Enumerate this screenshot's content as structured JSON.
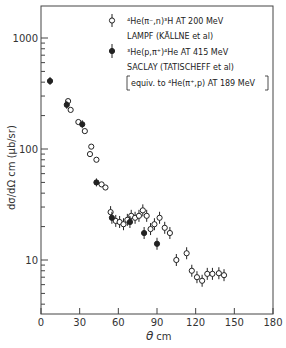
{
  "chart_data": {
    "type": "scatter",
    "title": "",
    "xlabel": "θ cm",
    "ylabel": "dσ/dΩ cm (μb/sr)",
    "xlim": [
      0,
      180
    ],
    "ylim": [
      6,
      1800
    ],
    "yscale": "log",
    "grid": false,
    "legend_position": "upper right",
    "x_ticks": [
      0,
      30,
      60,
      90,
      120,
      150,
      180
    ],
    "x_tick_labels": [
      "0",
      "30",
      "60",
      "90",
      "120",
      "150",
      "180"
    ],
    "y_ticks": [
      10,
      100,
      1000
    ],
    "y_tick_labels": [
      "10",
      "100",
      "1000"
    ],
    "series": [
      {
        "name": "4He(π−,n)3H AT 200 MeV — LAMPF (KÄLLNE et al)",
        "marker": "open-circle",
        "points": [
          {
            "x": 21,
            "y": 270
          },
          {
            "x": 23,
            "y": 225
          },
          {
            "x": 29,
            "y": 175
          },
          {
            "x": 34,
            "y": 145
          },
          {
            "x": 38,
            "y": 90
          },
          {
            "x": 39,
            "y": 105
          },
          {
            "x": 43,
            "y": 80
          },
          {
            "x": 47,
            "y": 48
          },
          {
            "x": 50,
            "y": 45
          },
          {
            "x": 54,
            "y": 27
          },
          {
            "x": 58,
            "y": 22.5
          },
          {
            "x": 61,
            "y": 22
          },
          {
            "x": 64,
            "y": 21
          },
          {
            "x": 67,
            "y": 23
          },
          {
            "x": 70,
            "y": 25
          },
          {
            "x": 73,
            "y": 24
          },
          {
            "x": 76,
            "y": 25
          },
          {
            "x": 79,
            "y": 28
          },
          {
            "x": 82,
            "y": 25
          },
          {
            "x": 85,
            "y": 19
          },
          {
            "x": 88,
            "y": 21
          },
          {
            "x": 92,
            "y": 24
          },
          {
            "x": 96,
            "y": 19.5
          },
          {
            "x": 100,
            "y": 17.5
          },
          {
            "x": 105,
            "y": 10
          },
          {
            "x": 113,
            "y": 11.5
          },
          {
            "x": 117,
            "y": 8
          },
          {
            "x": 121,
            "y": 7
          },
          {
            "x": 125,
            "y": 6.5
          },
          {
            "x": 129,
            "y": 7.5
          },
          {
            "x": 133,
            "y": 7.5
          },
          {
            "x": 138,
            "y": 7.6
          },
          {
            "x": 142,
            "y": 7.3
          }
        ]
      },
      {
        "name": "3He(p,π+)4He AT 415 MeV — SACLAY (TATISCHEFF et al) [equiv. to 4He(π+,p) AT 189 MeV]",
        "marker": "filled-circle",
        "points": [
          {
            "x": 7,
            "y": 410
          },
          {
            "x": 20,
            "y": 250
          },
          {
            "x": 32,
            "y": 167
          },
          {
            "x": 43,
            "y": 50
          },
          {
            "x": 55,
            "y": 24
          },
          {
            "x": 69,
            "y": 22
          },
          {
            "x": 80,
            "y": 17.5
          },
          {
            "x": 90,
            "y": 14
          }
        ]
      }
    ]
  },
  "axes": {
    "x_title_theta": "θ",
    "x_title_sub": "cm",
    "y_title": "dσ/dΩ cm  (μb/sr)",
    "x_tick_labels": [
      "0",
      "30",
      "60",
      "90",
      "120",
      "150",
      "180"
    ],
    "y_tick_labels": [
      "1000",
      "100",
      "10"
    ]
  },
  "legend": {
    "line1": "⁴He(π⁻,n)³H  AT  200 MeV",
    "line2": "LAMPF  (KÄLLNE et al)",
    "line3": "³He(p,π⁺)⁴He  AT  415 MeV",
    "line4": "SACLAY  (TATISCHEFF et al)",
    "line5": "equiv. to ⁴He(π⁺,p) AT 189 MeV"
  }
}
